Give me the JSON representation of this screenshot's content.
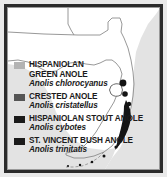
{
  "figure": {
    "kind": "species-distribution-map",
    "region": "Florida",
    "frame_color": "#2b2b2b",
    "land_color": "#ffffff",
    "water_color": "#e3e3e3",
    "outline_color": "#8c8c8c",
    "marker_color": "#141414"
  },
  "legend": {
    "entries": [
      {
        "swatch_color": "#b3b3b3",
        "common_name": "HISPANIOLAN",
        "common_name_line2": "GREEN ANOLE",
        "scientific_name": "Anolis chlorocyanus"
      },
      {
        "swatch_color": "#555555",
        "common_name": "CRESTED ANOLE",
        "common_name_line2": "",
        "scientific_name": "Anolis  cristatellus"
      },
      {
        "swatch_color": "#1a1a1a",
        "common_name": "HISPANIOLAN STOUT ANOLE",
        "common_name_line2": "",
        "scientific_name": "Anolis cybotes"
      },
      {
        "swatch_color": "#1a1a1a",
        "common_name": "ST. VINCENT BUSH ANOLE",
        "common_name_line2": "",
        "scientific_name": "Anolis trinitatis"
      }
    ]
  }
}
